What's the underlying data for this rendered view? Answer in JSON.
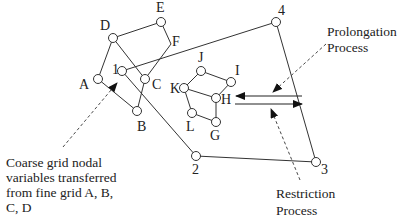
{
  "colors": {
    "line": "#333333",
    "text": "#222222",
    "background": "#ffffff"
  },
  "fine_grid_left": {
    "nodes": [
      {
        "id": "A",
        "label": "A"
      },
      {
        "id": "B",
        "label": "B"
      },
      {
        "id": "C",
        "label": "C"
      },
      {
        "id": "D",
        "label": "D"
      },
      {
        "id": "E",
        "label": "E"
      },
      {
        "id": "F",
        "label": "F"
      }
    ]
  },
  "fine_grid_right": {
    "nodes": [
      {
        "id": "G",
        "label": "G"
      },
      {
        "id": "H",
        "label": "H"
      },
      {
        "id": "I",
        "label": "I"
      },
      {
        "id": "J",
        "label": "J"
      },
      {
        "id": "K",
        "label": "K"
      },
      {
        "id": "L",
        "label": "L"
      }
    ]
  },
  "coarse_grid": {
    "nodes": [
      {
        "id": "1",
        "label": "1"
      },
      {
        "id": "2",
        "label": "2"
      },
      {
        "id": "3",
        "label": "3"
      },
      {
        "id": "4",
        "label": "4"
      }
    ]
  },
  "annotations": {
    "prolongation": [
      "Prolongation",
      "Process"
    ],
    "restriction": [
      "Restriction",
      "Process"
    ],
    "coarse_transfer": [
      "Coarse grid nodal",
      "variables transferred",
      "from fine grid A, B,",
      "C, D"
    ]
  }
}
